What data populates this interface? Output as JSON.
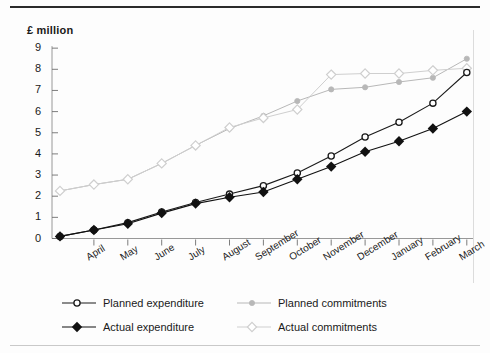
{
  "chart_data": {
    "type": "line",
    "title": "",
    "ylabel": "£ million",
    "xlabel": "",
    "ylim": [
      0,
      9
    ],
    "yticks": [
      0,
      1,
      2,
      3,
      4,
      5,
      6,
      7,
      8,
      9
    ],
    "ytick_labels": [
      "0",
      "1",
      "2",
      "3",
      "4",
      "5",
      "6",
      "7",
      "8",
      "9"
    ],
    "grid": false,
    "legend_position": "bottom",
    "categories": [
      "",
      "April",
      "May",
      "June",
      "July",
      "August",
      "September",
      "October",
      "November",
      "December",
      "January",
      "February",
      "March"
    ],
    "x": [
      0,
      1,
      2,
      3,
      4,
      5,
      6,
      7,
      8,
      9,
      10,
      11,
      12
    ],
    "series": [
      {
        "name": "Planned expenditure",
        "color": "#1a1a1a",
        "marker": "open-circle",
        "values": [
          0.1,
          0.4,
          0.75,
          1.25,
          1.7,
          2.1,
          2.5,
          3.1,
          3.9,
          4.8,
          5.5,
          6.4,
          7.85
        ]
      },
      {
        "name": "Planned commitments",
        "color": "#b8b8b8",
        "marker": "small-dot",
        "values": [
          2.25,
          2.55,
          2.8,
          3.55,
          4.4,
          5.2,
          5.8,
          6.5,
          7.05,
          7.15,
          7.4,
          7.6,
          8.5
        ]
      },
      {
        "name": "Actual expenditure",
        "color": "#111111",
        "marker": "filled-diamond",
        "values": [
          0.1,
          0.4,
          0.7,
          1.2,
          1.65,
          1.95,
          2.2,
          2.8,
          3.4,
          4.1,
          4.6,
          5.2,
          6.0
        ]
      },
      {
        "name": "Actual commitments",
        "color": "#cfcfcf",
        "marker": "open-diamond",
        "values": [
          2.25,
          2.55,
          2.8,
          3.55,
          4.4,
          5.25,
          5.7,
          6.1,
          7.75,
          7.8,
          7.8,
          7.95,
          8.05
        ]
      }
    ]
  },
  "legend": {
    "items": [
      {
        "label": "Planned expenditure",
        "marker": "open-circle",
        "color": "#1a1a1a"
      },
      {
        "label": "Planned commitments",
        "marker": "small-dot",
        "color": "#b8b8b8"
      },
      {
        "label": "Actual expenditure",
        "marker": "filled-diamond",
        "color": "#111111"
      },
      {
        "label": "Actual commitments",
        "marker": "open-diamond",
        "color": "#cfcfcf"
      }
    ]
  }
}
